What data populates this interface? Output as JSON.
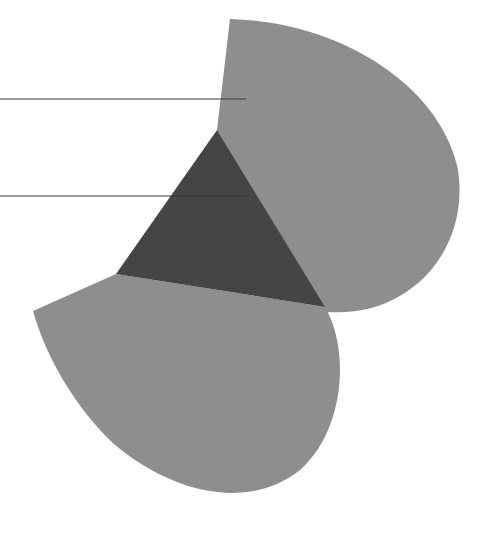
{
  "canvas": {
    "width": 479,
    "height": 536,
    "background": "#ffffff"
  },
  "colors": {
    "petal_fill": "#8e8e8e",
    "triangle_fill": "#454545",
    "leader_line": "#3a3a3a"
  },
  "shapes": {
    "upper_petal": {
      "path": "M230,19 C340,22 440,85 458,170 C470,250 410,318 327,312 L217,130 Z"
    },
    "lower_petal": {
      "path": "M33,311 L116,274 L325,307 C350,350 345,430 300,470 C250,510 175,495 115,445 C75,408 45,355 33,311 Z"
    },
    "center_triangle": {
      "points": "217,130 116,274 325,307"
    }
  },
  "leader_lines": [
    {
      "x1": 0,
      "y1": 99,
      "x2": 246,
      "y2": 99
    },
    {
      "x1": 0,
      "y1": 196,
      "x2": 246,
      "y2": 196
    }
  ]
}
